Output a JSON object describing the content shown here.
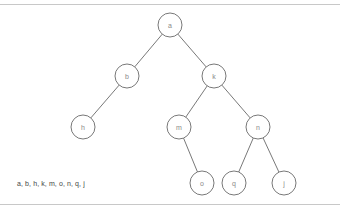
{
  "diagram": {
    "type": "binary-tree",
    "nodes": [
      {
        "id": "a",
        "label": "a",
        "x": 170,
        "y": 25
      },
      {
        "id": "b",
        "label": "b",
        "x": 127,
        "y": 76
      },
      {
        "id": "k",
        "label": "k",
        "x": 214,
        "y": 76
      },
      {
        "id": "h",
        "label": "h",
        "x": 83,
        "y": 127
      },
      {
        "id": "m",
        "label": "m",
        "x": 179,
        "y": 127
      },
      {
        "id": "n",
        "label": "n",
        "x": 258,
        "y": 127
      },
      {
        "id": "o",
        "label": "o",
        "x": 202,
        "y": 183
      },
      {
        "id": "q",
        "label": "q",
        "x": 234,
        "y": 183
      },
      {
        "id": "j",
        "label": "j",
        "x": 284,
        "y": 183
      }
    ],
    "edges": [
      [
        "a",
        "b"
      ],
      [
        "a",
        "k"
      ],
      [
        "b",
        "h"
      ],
      [
        "k",
        "m"
      ],
      [
        "k",
        "n"
      ],
      [
        "m",
        "o"
      ],
      [
        "n",
        "q"
      ],
      [
        "n",
        "j"
      ]
    ],
    "node_radius": 12,
    "stroke_color": "#555555",
    "label_color": "#8a8a8a"
  },
  "caption": "a, b, h, k, m, o, n, q, j"
}
